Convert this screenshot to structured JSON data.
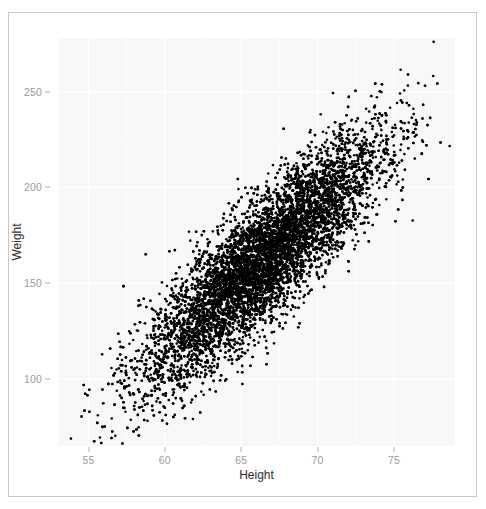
{
  "figure": {
    "frame_border_color": "#c9c9c9",
    "background_color": "#ffffff"
  },
  "chart_data": {
    "type": "scatter",
    "title": "",
    "subtitle": "",
    "xlabel": "Height",
    "ylabel": "Weight",
    "xlim": [
      53.0,
      79.0
    ],
    "ylim": [
      65.0,
      278.0
    ],
    "xticks": [
      55,
      60,
      65,
      70,
      75
    ],
    "xticklabels": [
      "55",
      "60",
      "65",
      "70",
      "75"
    ],
    "yticks": [
      100,
      150,
      200,
      250
    ],
    "yticklabels": [
      "100",
      "150",
      "200",
      "250"
    ],
    "grid": true,
    "grid_color": "#ffffff",
    "panel_background": "#f7f7f7",
    "legend": null,
    "legend_position": "none",
    "marker": {
      "shape": "circle",
      "color": "#000000",
      "size_px": 2.6,
      "alpha": 1.0
    },
    "series": [
      {
        "name": "observations",
        "n_points": 10000,
        "x_field": "Height",
        "y_field": "Weight",
        "distribution": "bivariate-normal",
        "x_mean": 66.37,
        "x_sd": 3.85,
        "y_mean": 161.4,
        "y_sd": 32.3,
        "correlation": 0.86,
        "x_observed_range": [
          53.4,
          78.8
        ],
        "y_observed_range": [
          66.0,
          276.0
        ]
      }
    ],
    "annotations": [
      {
        "label": "high outlier",
        "x": 77.6,
        "y": 276.0
      }
    ]
  }
}
